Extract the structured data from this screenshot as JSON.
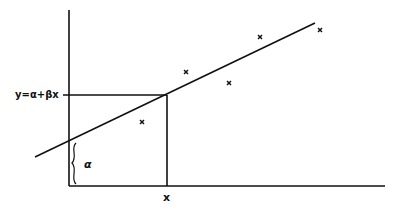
{
  "diagram": {
    "type": "linear-regression-illustration",
    "equation_label": "y=α+βx",
    "intercept_label": "α",
    "x_label": "x",
    "colors": {
      "ink": "#111111",
      "background": "#ffffff"
    },
    "axes": {
      "origin_px": [
        69,
        186
      ],
      "y_axis_top_px": [
        69,
        10
      ],
      "x_axis_end_px": [
        385,
        186
      ]
    },
    "regression_line_px": {
      "start": [
        35,
        157
      ],
      "end": [
        315,
        23
      ]
    },
    "intercept_px": [
      69,
      140
    ],
    "projection_point_px": [
      167,
      95
    ],
    "data_points_px": [
      [
        142,
        122
      ],
      [
        186,
        72
      ],
      [
        229,
        83
      ],
      [
        260,
        37
      ],
      [
        320,
        30
      ]
    ],
    "brace_px": {
      "x": 74,
      "top": 143,
      "bottom": 184
    }
  }
}
